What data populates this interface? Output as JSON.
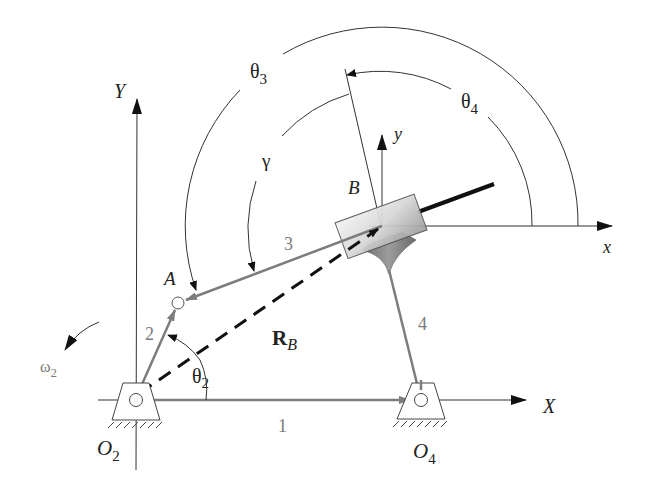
{
  "diagram": {
    "type": "inverted slider-crank / four-bar mechanism",
    "colors": {
      "link": "#7d7d7d",
      "thin_line": "#333333",
      "dashed_vector": "#111111",
      "background": "#ffffff"
    },
    "axes": {
      "global_x": "X",
      "global_y": "Y",
      "local_x": "x",
      "local_y": "y"
    },
    "points": {
      "A": "A",
      "B": "B",
      "O2_main": "O",
      "O2_sub": "2",
      "O4_main": "O",
      "O4_sub": "4"
    },
    "links": {
      "link1": "1",
      "link2": "2",
      "link3": "3",
      "link4": "4"
    },
    "angles": {
      "theta2_main": "θ",
      "theta2_sub": "2",
      "theta3_main": "θ",
      "theta3_sub": "3",
      "theta4_main": "θ",
      "theta4_sub": "4",
      "gamma": "γ",
      "omega2_main": "ω",
      "omega2_sub": "2"
    },
    "vectors": {
      "rb_main": "R",
      "rb_sub": "B"
    }
  }
}
